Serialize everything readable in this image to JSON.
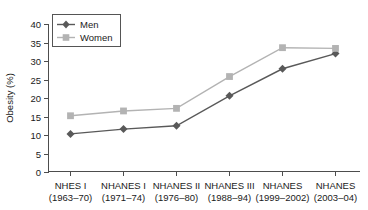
{
  "chart_data": {
    "type": "line",
    "title": "",
    "subtitle": "",
    "xlabel": "",
    "ylabel": "Obesity (%)",
    "ylim": [
      0,
      40
    ],
    "yticks": [
      0,
      5,
      10,
      15,
      20,
      25,
      30,
      35,
      40
    ],
    "ytick_labels": [
      "0",
      "5",
      "10",
      "15",
      "20",
      "25",
      "30",
      "35",
      "40"
    ],
    "grid": false,
    "legend_position": "top-left",
    "categories": [
      "NHES I\n(1963–70)",
      "NHANES I\n(1971–74)",
      "NHANES II\n(1976–80)",
      "NHANES III\n(1988–94)",
      "NHANES\n(1999–2002)",
      "NHANES\n(2003–04)"
    ],
    "category_lines": [
      [
        "NHES I",
        "(1963–70)"
      ],
      [
        "NHANES I",
        "(1971–74)"
      ],
      [
        "NHANES II",
        "(1976–80)"
      ],
      [
        "NHANES III",
        "(1988–94)"
      ],
      [
        "NHANES",
        "(1999–2002)"
      ],
      [
        "NHANES",
        "(2003–04)"
      ]
    ],
    "series": [
      {
        "name": "Men",
        "color": "#595959",
        "marker": "diamond",
        "values": [
          10.3,
          11.6,
          12.5,
          20.6,
          27.9,
          32.0
        ]
      },
      {
        "name": "Women",
        "color": "#b3b3b3",
        "marker": "square",
        "values": [
          15.2,
          16.5,
          17.2,
          25.8,
          33.6,
          33.4
        ]
      }
    ]
  },
  "legend": {
    "entries": [
      {
        "label": "Men"
      },
      {
        "label": "Women"
      }
    ]
  }
}
